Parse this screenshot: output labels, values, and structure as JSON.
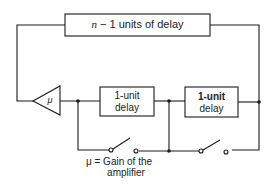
{
  "diagram": {
    "top_box_label": "n − 1 units of delay",
    "top_box_var": "n",
    "top_box_rest": "− 1 units of delay",
    "amplifier_symbol": "μ",
    "delay1_line1": "1-unit",
    "delay1_line2": "delay",
    "delay2_line1": "1-unit",
    "delay2_line2": "delay",
    "legend_line1": "μ = Gain of the",
    "legend_line2": "amplifier"
  },
  "colors": {
    "stroke": "#1a1a1a",
    "background": "#ffffff"
  }
}
